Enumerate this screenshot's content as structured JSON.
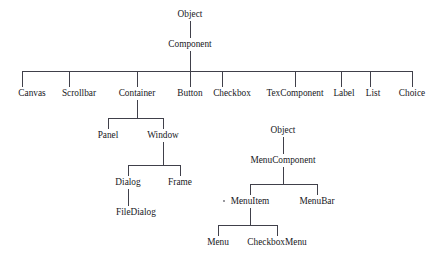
{
  "diagram": {
    "type": "tree-diagram",
    "background_color": "#ffffff",
    "line_color": "#40404a",
    "text_color": "#17171c",
    "nodes": [
      {
        "id": "object-top",
        "label": "Object",
        "x": 190,
        "y": 17
      },
      {
        "id": "component",
        "label": "Component",
        "x": 190,
        "y": 47
      },
      {
        "id": "canvas",
        "label": "Canvas",
        "x": 32,
        "y": 96
      },
      {
        "id": "scrollbar",
        "label": "Scrollbar",
        "x": 79,
        "y": 96
      },
      {
        "id": "container",
        "label": "Container",
        "x": 137,
        "y": 96
      },
      {
        "id": "button",
        "label": "Button",
        "x": 190,
        "y": 96
      },
      {
        "id": "checkbox",
        "label": "Checkbox",
        "x": 232,
        "y": 96
      },
      {
        "id": "texcomponent",
        "label": "TexComponent",
        "x": 295,
        "y": 96
      },
      {
        "id": "label",
        "label": "Label",
        "x": 344,
        "y": 96
      },
      {
        "id": "list",
        "label": "List",
        "x": 373,
        "y": 96
      },
      {
        "id": "choice",
        "label": "Choice",
        "x": 412,
        "y": 96
      },
      {
        "id": "panel",
        "label": "Panel",
        "x": 108,
        "y": 138
      },
      {
        "id": "window",
        "label": "Window",
        "x": 163,
        "y": 138
      },
      {
        "id": "dialog",
        "label": "Dialog",
        "x": 128,
        "y": 185
      },
      {
        "id": "frame",
        "label": "Frame",
        "x": 180,
        "y": 185
      },
      {
        "id": "filedialog",
        "label": "FileDialog",
        "x": 136,
        "y": 215
      },
      {
        "id": "object-menu",
        "label": "Object",
        "x": 283,
        "y": 133
      },
      {
        "id": "menucomponent",
        "label": "MenuComponent",
        "x": 283,
        "y": 163
      },
      {
        "id": "menuitem",
        "label": "MenuItem",
        "x": 250,
        "y": 204
      },
      {
        "id": "menubar",
        "label": "MenuBar",
        "x": 317,
        "y": 204
      },
      {
        "id": "menu",
        "label": "Menu",
        "x": 218,
        "y": 245
      },
      {
        "id": "checkboxmenu",
        "label": "CheckboxMenu",
        "x": 277,
        "y": 245
      }
    ],
    "edges": [
      {
        "id": "object-to-component",
        "from": "object-top",
        "to": "component",
        "kind": "vertical"
      },
      {
        "id": "component-to-bus",
        "from": "component",
        "to": "main-bus",
        "kind": "vertical"
      },
      {
        "id": "bus-main",
        "from": "component",
        "to": "children-row",
        "kind": "bus"
      },
      {
        "id": "container-to-bus2",
        "from": "container",
        "to": "panel-window",
        "kind": "bus"
      },
      {
        "id": "window-to-bus3",
        "from": "window",
        "to": "dialog-frame",
        "kind": "bus"
      },
      {
        "id": "dialog-to-filedialog",
        "from": "dialog",
        "to": "filedialog",
        "kind": "vertical"
      },
      {
        "id": "object-to-menucomp",
        "from": "object-menu",
        "to": "menucomponent",
        "kind": "vertical"
      },
      {
        "id": "menucomp-to-bus4",
        "from": "menucomponent",
        "to": "item-bar",
        "kind": "bus"
      },
      {
        "id": "menuitem-to-bus5",
        "from": "menuitem",
        "to": "menu-checkbox",
        "kind": "bus"
      }
    ],
    "speck_marker": {
      "id": "stray-speck",
      "x": 224,
      "y": 201
    }
  }
}
